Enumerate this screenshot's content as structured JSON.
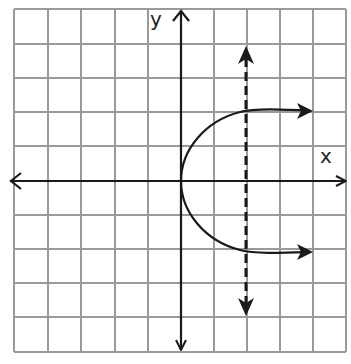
{
  "graph": {
    "x_label": "x",
    "y_label": "y",
    "grid": {
      "columns": 10,
      "rows": 10,
      "x_range": [
        -5,
        5
      ],
      "y_range": [
        -5,
        5
      ],
      "grid_color": "#9a9a9a"
    },
    "colors": {
      "axis": "#1a1a1a",
      "curve": "#1a1a1a",
      "dashed_line": "#1a1a1a"
    },
    "curve": {
      "description": "sideways parabola opening right, vertex at origin",
      "equation": "x = y^2 / 2",
      "vertex": [
        0,
        0
      ],
      "endpoints": [
        [
          3.9,
          2.1
        ],
        [
          3.9,
          -2.1
        ]
      ]
    },
    "dashed_line": {
      "description": "vertical dashed line with arrows at both ends",
      "x": 2,
      "y_range": [
        -3.9,
        3.9
      ]
    }
  }
}
